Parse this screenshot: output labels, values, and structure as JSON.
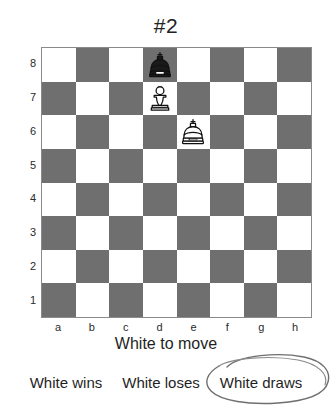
{
  "title": "#2",
  "board": {
    "files": [
      "a",
      "b",
      "c",
      "d",
      "e",
      "f",
      "g",
      "h"
    ],
    "ranks": [
      "8",
      "7",
      "6",
      "5",
      "4",
      "3",
      "2",
      "1"
    ],
    "light_color": "#ffffff",
    "dark_color": "#6f6f6f",
    "border_color": "#8a8a8a",
    "orientation": "white-bottom",
    "light_square_top_left": true,
    "pieces": [
      {
        "square": "d8",
        "piece": "black-king",
        "color": "black",
        "type": "king",
        "file": 3,
        "rank": 0
      },
      {
        "square": "d7",
        "piece": "white-pawn",
        "color": "white",
        "type": "pawn",
        "file": 3,
        "rank": 1
      },
      {
        "square": "e6",
        "piece": "white-king",
        "color": "white",
        "type": "king",
        "file": 4,
        "rank": 2
      }
    ]
  },
  "side_to_move": "White to move",
  "answers": [
    {
      "label": "White wins",
      "selected": false
    },
    {
      "label": "White loses",
      "selected": false
    },
    {
      "label": "White draws",
      "selected": true
    }
  ],
  "annotation": {
    "type": "hand-drawn-ellipse",
    "target": "White draws",
    "ink_color": "#6a6a6a"
  },
  "chart_data": {
    "type": "table",
    "title": "#2",
    "categories": [
      "a",
      "b",
      "c",
      "d",
      "e",
      "f",
      "g",
      "h"
    ],
    "values": [
      8,
      7,
      6,
      5,
      4,
      3,
      2,
      1
    ],
    "xlabel": "",
    "ylabel": "",
    "annotations": [
      "White to move",
      "White draws (circled)"
    ]
  }
}
